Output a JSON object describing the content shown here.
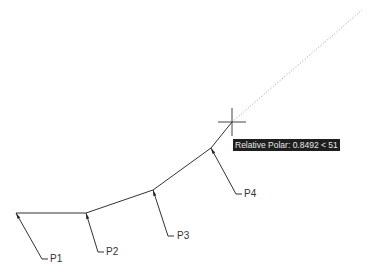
{
  "drawing": {
    "polyline_points": [
      [
        16,
        213
      ],
      [
        86,
        213
      ],
      [
        153,
        190
      ],
      [
        211,
        148
      ],
      [
        232,
        122
      ]
    ],
    "tracking_line": {
      "from": [
        232,
        122
      ],
      "to": [
        362,
        10
      ],
      "style": "dotted"
    },
    "crosshair": {
      "x": 232,
      "y": 122,
      "size": 14
    },
    "colors": {
      "line": "#333333",
      "tracking": "#9a9a9a",
      "crosshair": "#444444",
      "tooltip_bg": "#1e1e1e",
      "tooltip_text": "#e8e8e8"
    }
  },
  "callouts": [
    {
      "label": "P1",
      "point": [
        16,
        213
      ],
      "elbow": [
        42,
        259
      ],
      "end": [
        48,
        259
      ],
      "text_x": 50,
      "text_y": 254
    },
    {
      "label": "P2",
      "point": [
        86,
        213
      ],
      "elbow": [
        98,
        252
      ],
      "end": [
        104,
        252
      ],
      "text_x": 106,
      "text_y": 247
    },
    {
      "label": "P3",
      "point": [
        153,
        190
      ],
      "elbow": [
        168,
        236
      ],
      "end": [
        174,
        236
      ],
      "text_x": 177,
      "text_y": 231
    },
    {
      "label": "P4",
      "point": [
        211,
        148
      ],
      "elbow": [
        236,
        194
      ],
      "end": [
        242,
        194
      ],
      "text_x": 244,
      "text_y": 189
    }
  ],
  "tooltip": {
    "text": "Relative Polar: 0.8492 < 51"
  }
}
